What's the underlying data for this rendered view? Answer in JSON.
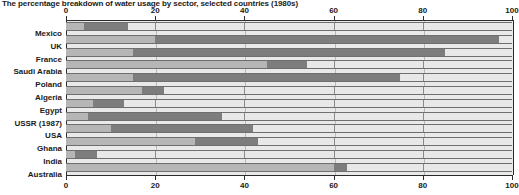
{
  "chart_data": {
    "type": "bar",
    "orientation": "horizontal",
    "stacked": true,
    "title": "The percentage breakdown of water usage by sector, selected countries (1980s)",
    "xlabel": "",
    "ylabel": "",
    "xlim": [
      0,
      100
    ],
    "xticks": [
      0,
      20,
      40,
      60,
      80,
      100
    ],
    "xtick_labels": [
      "0",
      "20",
      "40",
      "60",
      "80",
      "100"
    ],
    "grid": true,
    "axis_top": true,
    "axis_bottom": true,
    "legend": "none",
    "categories": [
      "Mexico",
      "UK",
      "France",
      "Saudi Arabia",
      "Poland",
      "Algeria",
      "Egypt",
      "USSR (1987)",
      "USA",
      "Ghana",
      "India",
      "Australia"
    ],
    "series": [
      {
        "name": "domestic",
        "color": "#b6b6b6",
        "values": [
          4,
          20,
          15,
          45,
          15,
          17,
          6,
          5,
          10,
          29,
          2,
          60
        ]
      },
      {
        "name": "industry",
        "color": "#7d7d7d",
        "values": [
          10,
          77,
          70,
          9,
          60,
          5,
          7,
          30,
          32,
          14,
          5,
          3
        ]
      },
      {
        "name": "agriculture",
        "color": "#e8e8e8",
        "values": [
          86,
          3,
          15,
          46,
          25,
          78,
          87,
          65,
          58,
          57,
          93,
          37
        ]
      }
    ],
    "cumulative_boundaries": [
      [
        4,
        14
      ],
      [
        20,
        97
      ],
      [
        15,
        85
      ],
      [
        45,
        54
      ],
      [
        15,
        75
      ],
      [
        17,
        22
      ],
      [
        6,
        13
      ],
      [
        5,
        35
      ],
      [
        10,
        42
      ],
      [
        29,
        43
      ],
      [
        2,
        7
      ],
      [
        60,
        63
      ]
    ]
  },
  "colors": {
    "segment_a": "#b6b6b6",
    "segment_b": "#7d7d7d",
    "segment_c": "#e8e8e8",
    "axis": "#2b2b2b",
    "grid": "#b9b9b9",
    "background": "#ffffff"
  }
}
